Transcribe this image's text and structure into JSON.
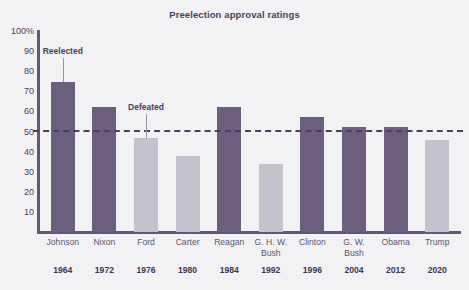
{
  "chart_data": {
    "type": "bar",
    "title": "Preelection approval ratings",
    "xlabel": "",
    "ylabel": "",
    "ylim": [
      0,
      100
    ],
    "grid": false,
    "legend_position": "none",
    "y_ticks": [
      "100%",
      "90",
      "80",
      "70",
      "60",
      "50",
      "40",
      "30",
      "20",
      "10"
    ],
    "y_tick_values": [
      100,
      90,
      80,
      70,
      60,
      50,
      40,
      30,
      20,
      10
    ],
    "reference_line": {
      "value": 50,
      "style": "dashed",
      "label": ""
    },
    "categories": [
      "Johnson",
      "Nixon",
      "Ford",
      "Carter",
      "Reagan",
      "G. H. W. Bush",
      "Clinton",
      "G. W. Bush",
      "Obama",
      "Trump"
    ],
    "years": [
      "1964",
      "1972",
      "1976",
      "1980",
      "1984",
      "1992",
      "1996",
      "2004",
      "2012",
      "2020"
    ],
    "values": [
      74.5,
      62,
      47,
      38,
      62,
      34,
      57,
      52,
      52,
      46
    ],
    "outcomes": [
      "reelected",
      "reelected",
      "defeated",
      "defeated",
      "reelected",
      "defeated",
      "reelected",
      "reelected",
      "reelected",
      "defeated"
    ],
    "annotations": [
      {
        "text": "Reelected",
        "points_to": "Johnson"
      },
      {
        "text": "Defeated",
        "points_to": "Ford"
      }
    ],
    "colors": {
      "reelected": "#6b5f7d",
      "defeated": "#c5c2cd",
      "axis": "#63567a",
      "text": "#4b3f5e",
      "background": "#f2f2f4"
    }
  },
  "bars": [
    {
      "name": "Johnson",
      "year": "1964",
      "value": 74.5,
      "outcome": "reelected"
    },
    {
      "name": "Nixon",
      "year": "1972",
      "value": 62,
      "outcome": "reelected"
    },
    {
      "name": "Ford",
      "year": "1976",
      "value": 47,
      "outcome": "defeated"
    },
    {
      "name": "Carter",
      "year": "1980",
      "value": 38,
      "outcome": "defeated"
    },
    {
      "name": "Reagan",
      "year": "1984",
      "value": 62,
      "outcome": "reelected"
    },
    {
      "name": "G. H. W. Bush",
      "year": "1992",
      "value": 34,
      "outcome": "defeated"
    },
    {
      "name": "Clinton",
      "year": "1996",
      "value": 57,
      "outcome": "reelected"
    },
    {
      "name": "G. W. Bush",
      "year": "2004",
      "value": 52,
      "outcome": "reelected"
    },
    {
      "name": "Obama",
      "year": "2012",
      "value": 52,
      "outcome": "reelected"
    },
    {
      "name": "Trump",
      "year": "2020",
      "value": 46,
      "outcome": "defeated"
    }
  ],
  "x_labels": [
    {
      "lines": [
        "Johnson"
      ],
      "year": "1964"
    },
    {
      "lines": [
        "Nixon"
      ],
      "year": "1972"
    },
    {
      "lines": [
        "Ford"
      ],
      "year": "1976"
    },
    {
      "lines": [
        "Carter"
      ],
      "year": "1980"
    },
    {
      "lines": [
        "Reagan"
      ],
      "year": "1984"
    },
    {
      "lines": [
        "G. H. W.",
        "Bush"
      ],
      "year": "1992"
    },
    {
      "lines": [
        "Clinton"
      ],
      "year": "1996"
    },
    {
      "lines": [
        "G. W.",
        "Bush"
      ],
      "year": "2004"
    },
    {
      "lines": [
        "Obama"
      ],
      "year": "2012"
    },
    {
      "lines": [
        "Trump"
      ],
      "year": "2020"
    }
  ]
}
